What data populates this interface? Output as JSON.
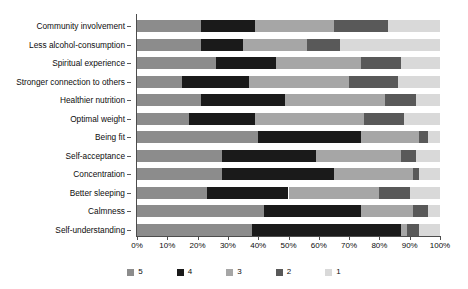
{
  "chart_data": {
    "type": "bar",
    "orientation": "horizontal",
    "stacked": true,
    "normalized": true,
    "title": "",
    "xlabel": "",
    "ylabel": "",
    "xlim": [
      0,
      100
    ],
    "grid": false,
    "legend_position": "bottom",
    "categories": [
      "Community involvement",
      "Less alcohol-consumption",
      "Spiritual experience",
      "Stronger connection to others",
      "Healthier nutrition",
      "Optimal weight",
      "Being fit",
      "Self-acceptance",
      "Concentration",
      "Better sleeping",
      "Calmness",
      "Self-understanding"
    ],
    "xticks": [
      "0%",
      "10%",
      "20%",
      "30%",
      "40%",
      "50%",
      "60%",
      "70%",
      "80%",
      "90%",
      "100%"
    ],
    "xtick_values": [
      0,
      10,
      20,
      30,
      40,
      50,
      60,
      70,
      80,
      90,
      100
    ],
    "series": [
      {
        "name": "5",
        "color": "#8c8c8c",
        "values": [
          21,
          21,
          26,
          15,
          21,
          17,
          40,
          28,
          28,
          23,
          42,
          38
        ]
      },
      {
        "name": "4",
        "color": "#1a1a1a",
        "values": [
          18,
          14,
          20,
          22,
          28,
          22,
          34,
          31,
          37,
          27,
          32,
          49
        ]
      },
      {
        "name": "3",
        "color": "#a6a6a6",
        "values": [
          26,
          21,
          28,
          33,
          33,
          36,
          19,
          28,
          26,
          30,
          17,
          2
        ]
      },
      {
        "name": "2",
        "color": "#595959",
        "values": [
          18,
          11,
          13,
          16,
          10,
          13,
          3,
          5,
          2,
          10,
          5,
          4
        ]
      },
      {
        "name": "1",
        "color": "#d9d9d9",
        "values": [
          17,
          33,
          13,
          14,
          8,
          12,
          4,
          8,
          7,
          10,
          4,
          7
        ]
      }
    ]
  },
  "legend": {
    "items": [
      {
        "label": "5",
        "color": "#8c8c8c"
      },
      {
        "label": "4",
        "color": "#1a1a1a"
      },
      {
        "label": "3",
        "color": "#a6a6a6"
      },
      {
        "label": "2",
        "color": "#595959"
      },
      {
        "label": "1",
        "color": "#d9d9d9"
      }
    ]
  },
  "axis": {
    "line_color": "#4d4d4d"
  }
}
